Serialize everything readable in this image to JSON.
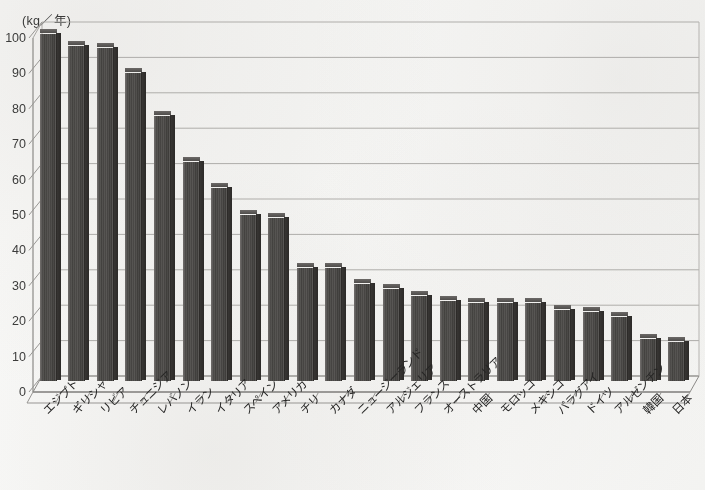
{
  "chart_data": {
    "type": "bar",
    "title": "",
    "subtitle": "",
    "xlabel": "",
    "ylabel": "(kg／年)",
    "ylim": [
      0,
      100
    ],
    "ytick_labels": [
      "100",
      "90",
      "80",
      "70",
      "60",
      "50",
      "40",
      "30",
      "20",
      "10",
      "0"
    ],
    "ytick_values": [
      100,
      90,
      80,
      70,
      60,
      50,
      40,
      30,
      20,
      10,
      0
    ],
    "grid": true,
    "grid_axis": "y",
    "legend": false,
    "legend_position": "none",
    "style_3d": true,
    "bar_color": "#494640",
    "categories": [
      "エジプト",
      "ギリシャ",
      "リビア",
      "チュニジア",
      "レバノン",
      "イラン",
      "イタリア",
      "スペイン",
      "アメリカ",
      "チリ",
      "カナダ",
      "ニュージーランド",
      "アルジェリア",
      "フランス",
      "オーストラリア",
      "中国",
      "モロッコ",
      "メキシコ",
      "パラグアイ",
      "ドイツ",
      "アルゼンチン",
      "韓国",
      "日本"
    ],
    "values": [
      98,
      94.5,
      94,
      87,
      75,
      62,
      54.5,
      47,
      46,
      32,
      32,
      27.5,
      26,
      24,
      22.5,
      22,
      22,
      22,
      20,
      19.5,
      18,
      12,
      11
    ]
  },
  "colors": {
    "bar": "#494640",
    "gridline": "#b5b2ab",
    "axis": "#8e8b85",
    "text": "#2a2926",
    "paper": "#f8f7f4"
  }
}
